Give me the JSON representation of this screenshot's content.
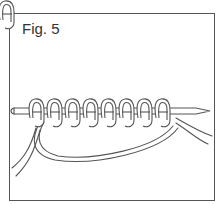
{
  "figure": {
    "caption": "Fig. 5",
    "stitch_count": 8,
    "colors": {
      "stroke": "#555555",
      "fill": "#ffffff",
      "border": "#555555"
    }
  }
}
